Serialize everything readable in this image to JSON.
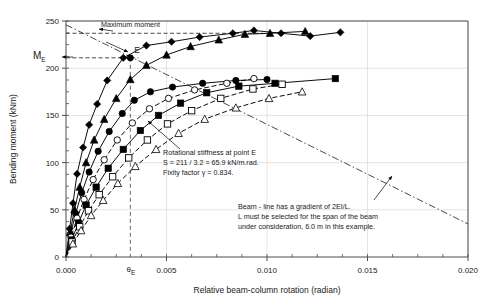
{
  "chart_data": {
    "type": "line",
    "title": "",
    "xlabel": "Relative beam-column rotation (radian)",
    "ylabel": "Bending moment (kNm)",
    "xlim": [
      0.0,
      0.02
    ],
    "ylim": [
      0,
      250
    ],
    "xticks": [
      0.0,
      0.005,
      0.01,
      0.015,
      0.02
    ],
    "xtick_labels": [
      "0.000",
      "0.005",
      "0.010",
      "0.015",
      "0.020"
    ],
    "xminor_step": 0.00125,
    "yticks": [
      0,
      50,
      100,
      150,
      200,
      250
    ],
    "ytick_labels": [
      "0",
      "50",
      "100",
      "150",
      "200",
      "250"
    ],
    "grid": true,
    "legend_position": "none",
    "special_y_label": "M_E",
    "special_y_value": 211,
    "special_x_label": "theta_E",
    "special_x_value": 0.0032,
    "maximum_moment_value": 237,
    "series": [
      {
        "name": "series-1-filled-diamond",
        "marker": "filled-diamond",
        "linestyle": "solid",
        "points": [
          [
            0.0,
            0
          ],
          [
            0.00018,
            30
          ],
          [
            0.00035,
            57
          ],
          [
            0.00055,
            88
          ],
          [
            0.00085,
            116
          ],
          [
            0.00115,
            140
          ],
          [
            0.00155,
            162
          ],
          [
            0.00205,
            187
          ],
          [
            0.00285,
            211
          ],
          [
            0.004,
            224
          ],
          [
            0.00525,
            228
          ],
          [
            0.00665,
            233
          ],
          [
            0.0083,
            237
          ],
          [
            0.00935,
            240
          ],
          [
            0.0107,
            237
          ],
          [
            0.01215,
            234
          ],
          [
            0.01365,
            238
          ]
        ]
      },
      {
        "name": "series-2-filled-triangle",
        "marker": "filled-triangle",
        "linestyle": "solid",
        "points": [
          [
            0.0,
            0
          ],
          [
            0.0002,
            26
          ],
          [
            0.00042,
            50
          ],
          [
            0.00068,
            74
          ],
          [
            0.001,
            100
          ],
          [
            0.0014,
            124
          ],
          [
            0.0019,
            146
          ],
          [
            0.0025,
            168
          ],
          [
            0.0032,
            188
          ],
          [
            0.004,
            203
          ],
          [
            0.005,
            214
          ],
          [
            0.0062,
            223
          ],
          [
            0.0076,
            230
          ],
          [
            0.0089,
            236
          ],
          [
            0.01015,
            237
          ],
          [
            0.0119,
            239
          ]
        ]
      },
      {
        "name": "series-3-filled-circle",
        "marker": "filled-circle",
        "linestyle": "solid",
        "points": [
          [
            0.0,
            0
          ],
          [
            0.00022,
            24
          ],
          [
            0.00048,
            46
          ],
          [
            0.00078,
            68
          ],
          [
            0.00115,
            90
          ],
          [
            0.0016,
            112
          ],
          [
            0.00215,
            133
          ],
          [
            0.0028,
            152
          ],
          [
            0.0034,
            166
          ],
          [
            0.0042,
            175
          ],
          [
            0.0053,
            180
          ],
          [
            0.0068,
            184
          ],
          [
            0.00845,
            187
          ],
          [
            0.01,
            188
          ]
        ]
      },
      {
        "name": "series-4-open-circle",
        "marker": "open-circle",
        "linestyle": "dashed",
        "points": [
          [
            0.0,
            0
          ],
          [
            0.00025,
            21
          ],
          [
            0.00055,
            41
          ],
          [
            0.0009,
            61
          ],
          [
            0.00135,
            82
          ],
          [
            0.0019,
            103
          ],
          [
            0.00255,
            124
          ],
          [
            0.0033,
            142
          ],
          [
            0.00415,
            157
          ],
          [
            0.0051,
            168
          ],
          [
            0.0064,
            177
          ],
          [
            0.008,
            184
          ],
          [
            0.00935,
            189
          ]
        ]
      },
      {
        "name": "series-5-filled-square",
        "marker": "filled-square",
        "linestyle": "solid",
        "points": [
          [
            0.0,
            0
          ],
          [
            0.00028,
            18
          ],
          [
            0.00062,
            36
          ],
          [
            0.001,
            55
          ],
          [
            0.0015,
            74
          ],
          [
            0.0021,
            94
          ],
          [
            0.00285,
            114
          ],
          [
            0.0037,
            134
          ],
          [
            0.0046,
            150
          ],
          [
            0.0057,
            163
          ],
          [
            0.007,
            174
          ],
          [
            0.0086,
            181
          ],
          [
            0.0104,
            184
          ],
          [
            0.0134,
            189
          ]
        ]
      },
      {
        "name": "series-6-open-square",
        "marker": "open-square",
        "linestyle": "dashed",
        "points": [
          [
            0.0,
            0
          ],
          [
            0.0003,
            16
          ],
          [
            0.00068,
            32
          ],
          [
            0.00112,
            49
          ],
          [
            0.00165,
            66
          ],
          [
            0.00232,
            85
          ],
          [
            0.00312,
            105
          ],
          [
            0.00405,
            124
          ],
          [
            0.00505,
            141
          ],
          [
            0.00625,
            155
          ],
          [
            0.0077,
            168
          ],
          [
            0.0093,
            178
          ],
          [
            0.01075,
            183
          ]
        ]
      },
      {
        "name": "series-7-open-triangle",
        "marker": "open-triangle",
        "linestyle": "dashed",
        "points": [
          [
            0.0,
            0
          ],
          [
            0.00034,
            14
          ],
          [
            0.00075,
            28
          ],
          [
            0.00125,
            44
          ],
          [
            0.00185,
            60
          ],
          [
            0.00258,
            78
          ],
          [
            0.00345,
            96
          ],
          [
            0.00448,
            114
          ],
          [
            0.0056,
            131
          ],
          [
            0.0069,
            146
          ],
          [
            0.00845,
            158
          ],
          [
            0.0101,
            168
          ],
          [
            0.01175,
            175
          ]
        ]
      }
    ],
    "reference_lines": [
      {
        "name": "maximum-moment-line",
        "style": "dashed",
        "orientation": "horizontal",
        "value": 237,
        "label": "Maximum moment"
      },
      {
        "name": "me-level-line",
        "style": "dashed",
        "orientation": "horizontal",
        "value": 211
      },
      {
        "name": "theta-e-line",
        "style": "dashed",
        "orientation": "vertical",
        "value": 0.0032
      },
      {
        "name": "beam-line",
        "style": "dash-dot",
        "orientation": "diagonal",
        "from": [
          0.0,
          246
        ],
        "to": [
          0.02,
          35
        ],
        "description": "Beam - line has a gradient of 2EI/L."
      }
    ],
    "annotations": [
      {
        "name": "point-e-label",
        "text": "E",
        "x": 0.0032,
        "y": 211
      },
      {
        "name": "maximum-moment-label",
        "text": "Maximum moment"
      },
      {
        "name": "stiffness-note",
        "lines": [
          "Rotational stiffness at point E",
          "S = 211 / 3.2 = 65.9 kN/m.rad.",
          "Fixity factor γ = 0.834."
        ]
      },
      {
        "name": "beam-line-note",
        "lines": [
          "Beam - line has a gradient of 2EI/L.",
          "L must be selected for the span of the beam",
          "under consideration, 6.0 m in this example."
        ]
      }
    ],
    "colors": {
      "line": "#000000",
      "grid": "#d9d9d9",
      "axis": "#4d4d4d",
      "text": "#1a1a1a"
    }
  },
  "axes": {
    "x_title": "Relative beam-column rotation (radian)",
    "y_title": "Bending moment (kNm)",
    "theta_e_tick": "θ",
    "theta_e_sub": "E",
    "me_main": "M",
    "me_sub": "E"
  }
}
